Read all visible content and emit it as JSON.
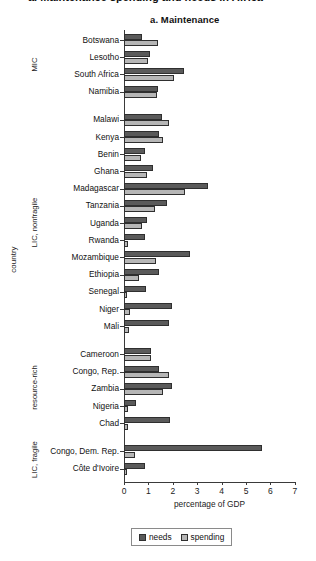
{
  "header": {
    "clipped_title": "a. Maintenance spending and needs in Africa"
  },
  "panel": {
    "title": "a. Maintenance"
  },
  "axes": {
    "y_title": "country",
    "x_title": "percentage of GDP",
    "x_ticks": [
      "0",
      "1",
      "2",
      "3",
      "4",
      "5",
      "6",
      "7"
    ]
  },
  "legend": {
    "needs": "needs",
    "spending": "spending"
  },
  "colors": {
    "needs": "#5a5a5a",
    "spending": "#b6b6b6",
    "axis": "#3a3a3a"
  },
  "groups": [
    {
      "label": "MIC",
      "countries": [
        "Botswana",
        "Lesotho",
        "South Africa",
        "Namibia"
      ]
    },
    {
      "label": "LIC, nonfragile",
      "countries": [
        "Malawi",
        "Kenya",
        "Benin",
        "Ghana",
        "Madagascar",
        "Tanzania",
        "Uganda",
        "Rwanda",
        "Mozambique",
        "Ethiopia",
        "Senegal",
        "Niger",
        "Mali"
      ]
    },
    {
      "label": "resource-rich",
      "countries": [
        "Cameroon",
        "Congo, Rep.",
        "Zambia",
        "Nigeria",
        "Chad"
      ]
    },
    {
      "label": "LIC, fragile",
      "countries": [
        "Congo, Dem. Rep.",
        "Côte d'Ivoire"
      ]
    }
  ],
  "chart_data": {
    "type": "bar",
    "orientation": "horizontal",
    "title": "a. Maintenance",
    "xlabel": "percentage of GDP",
    "ylabel": "country",
    "xlim": [
      0,
      7
    ],
    "xticks": [
      0,
      1,
      2,
      3,
      4,
      5,
      6,
      7
    ],
    "grid": false,
    "legend_position": "bottom",
    "categories": [
      "Botswana",
      "Lesotho",
      "South Africa",
      "Namibia",
      "Malawi",
      "Kenya",
      "Benin",
      "Ghana",
      "Madagascar",
      "Tanzania",
      "Uganda",
      "Rwanda",
      "Mozambique",
      "Ethiopia",
      "Senegal",
      "Niger",
      "Mali",
      "Cameroon",
      "Congo, Rep.",
      "Zambia",
      "Nigeria",
      "Chad",
      "Congo, Dem. Rep.",
      "Côte d'Ivoire"
    ],
    "series": [
      {
        "name": "needs",
        "color": "#5a5a5a",
        "values": [
          0.75,
          1.05,
          2.45,
          1.4,
          1.55,
          1.45,
          0.85,
          1.2,
          3.45,
          1.75,
          0.95,
          0.85,
          2.7,
          1.45,
          0.9,
          1.95,
          1.85,
          1.1,
          1.45,
          1.95,
          0.5,
          1.9,
          5.65,
          0.85
        ]
      },
      {
        "name": "spending",
        "color": "#b6b6b6",
        "values": [
          1.4,
          1.0,
          2.05,
          1.35,
          1.85,
          1.6,
          0.7,
          0.95,
          2.5,
          1.25,
          0.75,
          0.15,
          1.3,
          0.6,
          0.12,
          0.25,
          0.2,
          1.1,
          1.85,
          1.6,
          0.15,
          0.15,
          0.45,
          0.12
        ]
      }
    ]
  }
}
